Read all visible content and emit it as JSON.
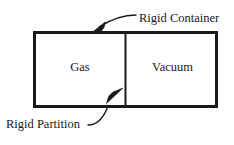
{
  "figure": {
    "background_color": "#ffffff",
    "stroke_color": "#1a1a1a",
    "text_color": "#1a1a1a",
    "width": 234,
    "height": 145
  },
  "container": {
    "label": "Rigid Container",
    "border_color": "#1a1a1a",
    "border_width": 3,
    "fill": "#ffffff",
    "x": 33,
    "y": 31,
    "width": 185,
    "height": 77
  },
  "partition": {
    "label": "Rigid Partition",
    "color": "#1a1a1a",
    "width": 2,
    "x": 125
  },
  "chambers": [
    {
      "name": "left-chamber",
      "label": "Gas"
    },
    {
      "name": "right-chamber",
      "label": "Vacuum"
    }
  ],
  "annotations": [
    {
      "name": "rigid-container-annotation",
      "label": "Rigid Container",
      "target": "container-top-edge",
      "arrow_direction": "down-left"
    },
    {
      "name": "rigid-partition-annotation",
      "label": "Rigid Partition",
      "target": "partition-lower-section",
      "arrow_direction": "up-right"
    }
  ]
}
